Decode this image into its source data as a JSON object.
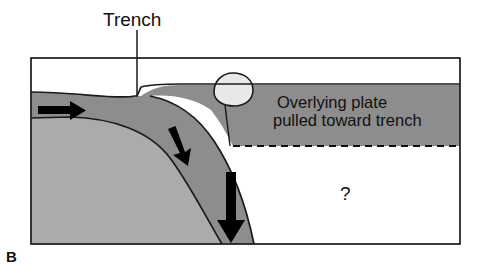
{
  "figure": {
    "panel_letter": "B",
    "type": "subduction-zone-cross-section",
    "title_note": "Slab pull / trench suction diagram"
  },
  "labels": {
    "trench": "Trench",
    "overlying_plate_line1": "Overlying plate",
    "overlying_plate_line2": "pulled toward trench",
    "question_mark": "?"
  },
  "colors": {
    "background": "#ffffff",
    "frame_stroke": "#1a1a1a",
    "subducting_slab": "#8d8d8d",
    "lower_mantle_block": "#ababab",
    "overlying_plate": "#8d8d8d",
    "island_arc": "#e8e8e8",
    "arrow_fill": "#000000",
    "dashed_line": "#111111",
    "text": "#111111"
  },
  "frame": {
    "x": 31,
    "y": 58,
    "width": 429,
    "height": 186
  },
  "annotations": {
    "trench_leader_line": {
      "x": 137,
      "y_start": 30,
      "y_end": 96
    },
    "dashed_boundary": {
      "y": 146,
      "x_start": 233,
      "x_end": 460,
      "meaning": "base of overlying plate / unknown deep boundary"
    },
    "arrows": [
      {
        "name": "plate-motion-arrow",
        "direction": "right",
        "meaning": "subducting plate moves toward trench",
        "x": 40,
        "y": 110
      },
      {
        "name": "slab-descent-arrow-upper",
        "direction": "down-right",
        "meaning": "slab begins to descend",
        "x": 172,
        "y": 132
      },
      {
        "name": "slab-pull-arrow-lower",
        "direction": "down",
        "meaning": "slab pull force",
        "x": 231,
        "y": 175
      }
    ],
    "island_arc": {
      "name": "volcanic-island-arc",
      "cx": 231,
      "cy": 94
    }
  }
}
